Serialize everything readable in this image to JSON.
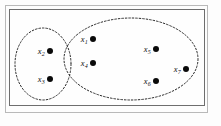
{
  "figure": {
    "title": "",
    "background_color": "#fdfdfd",
    "frame": {
      "outer_color": "#b9b9b9",
      "inner_color": "#6e6e6e"
    },
    "dot_color": "#0a0a0a",
    "ellipse_color": "#2a2a2a",
    "ellipse_style": "dashed"
  },
  "clusters": [
    {
      "id": "cluster-left",
      "name": "left-cluster",
      "cx": 43,
      "cy": 64,
      "rx": 28,
      "ry": 36,
      "member_count": 2,
      "members": [
        "x2",
        "x3"
      ]
    },
    {
      "id": "cluster-right",
      "name": "right-cluster",
      "cx": 131,
      "cy": 59,
      "rx": 67,
      "ry": 41,
      "member_count": 5,
      "members": [
        "x1",
        "x4",
        "x5",
        "x6",
        "x7"
      ]
    }
  ],
  "points": [
    {
      "id": "x1",
      "base": "x",
      "sub": "1",
      "x": 93,
      "y": 38,
      "cluster": "cluster-right"
    },
    {
      "id": "x2",
      "base": "x",
      "sub": "2",
      "x": 50,
      "y": 50,
      "cluster": "cluster-left"
    },
    {
      "id": "x3",
      "base": "x",
      "sub": "3",
      "x": 50,
      "y": 78,
      "cluster": "cluster-left"
    },
    {
      "id": "x4",
      "base": "x",
      "sub": "4",
      "x": 93,
      "y": 62,
      "cluster": "cluster-right"
    },
    {
      "id": "x5",
      "base": "x",
      "sub": "5",
      "x": 156,
      "y": 48,
      "cluster": "cluster-right"
    },
    {
      "id": "x6",
      "base": "x",
      "sub": "6",
      "x": 156,
      "y": 80,
      "cluster": "cluster-right"
    },
    {
      "id": "x7",
      "base": "x",
      "sub": "7",
      "x": 186,
      "y": 68,
      "cluster": "cluster-right"
    }
  ]
}
